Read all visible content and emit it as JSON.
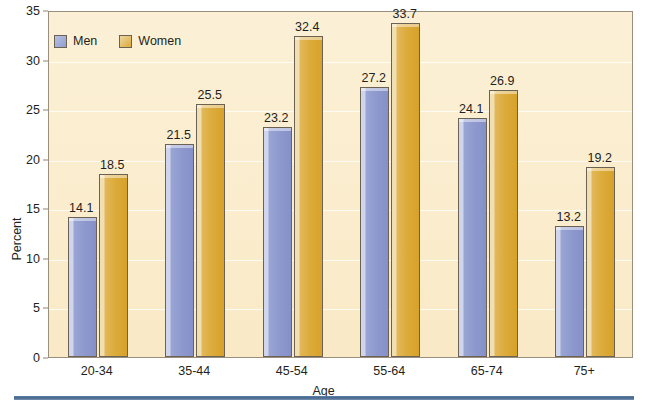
{
  "chart_data": {
    "type": "bar",
    "title": "",
    "subtitle": "",
    "xlabel": "Age",
    "ylabel": "Percent",
    "categories": [
      "20-34",
      "35-44",
      "45-54",
      "55-64",
      "65-74",
      "75+"
    ],
    "series": [
      {
        "name": "Men",
        "color": "#8e9ace",
        "values": [
          14.1,
          21.5,
          23.2,
          27.2,
          24.1,
          13.2
        ]
      },
      {
        "name": "Women",
        "color": "#dcab3b",
        "values": [
          18.5,
          25.5,
          32.4,
          33.7,
          26.9,
          19.2
        ]
      }
    ],
    "ylim": [
      0,
      35
    ],
    "yticks": [
      0,
      5,
      10,
      15,
      20,
      25,
      30,
      35
    ],
    "ytick_labels": [
      "0",
      "5",
      "10",
      "15",
      "20",
      "25",
      "30",
      "35"
    ],
    "grid": true,
    "grid_axis": "y",
    "legend_position": "top-left",
    "data_labels": true,
    "plot_background": "#fbeed0",
    "frame_color": "#9a8f7d",
    "rule_color": "#46678c"
  },
  "legend": {
    "items": [
      {
        "label": "Men"
      },
      {
        "label": "Women"
      }
    ]
  },
  "axes": {
    "y_title": "Percent",
    "x_title": "Age"
  }
}
